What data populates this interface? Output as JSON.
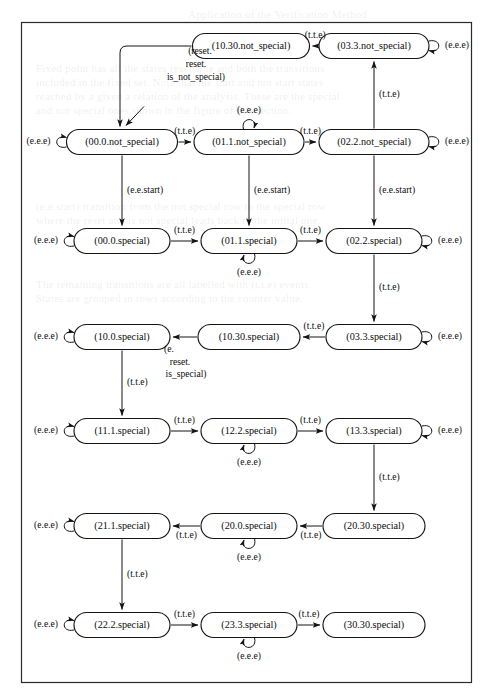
{
  "figure": {
    "kind": "state-transition-diagram",
    "width": 493,
    "height": 699,
    "frame": {
      "x": 21,
      "y": 22,
      "width": 451,
      "height": 661
    },
    "ink_color": "#141414",
    "background": "#ffffff"
  },
  "nodes": [
    {
      "id": "n_10_30_ns",
      "label": "(10.30.not_special)",
      "cx": 251,
      "cy": 46,
      "w": 117,
      "h": 25
    },
    {
      "id": "n_03_3_ns",
      "label": "(03.3.not_special)",
      "cx": 374,
      "cy": 46,
      "w": 110,
      "h": 25
    },
    {
      "id": "n_00_0_ns",
      "label": "(00.0.not_special)",
      "cx": 122,
      "cy": 142,
      "w": 111,
      "h": 25
    },
    {
      "id": "n_01_1_ns",
      "label": "(01.1.not_special)",
      "cx": 249,
      "cy": 142,
      "w": 110,
      "h": 25
    },
    {
      "id": "n_02_2_ns",
      "label": "(02.2.not_special)",
      "cx": 374,
      "cy": 142,
      "w": 110,
      "h": 25
    },
    {
      "id": "n_00_0_s",
      "label": "(00.0.special)",
      "cx": 122,
      "cy": 241,
      "w": 96,
      "h": 25
    },
    {
      "id": "n_01_1_s",
      "label": "(01.1.special)",
      "cx": 249,
      "cy": 241,
      "w": 96,
      "h": 25
    },
    {
      "id": "n_02_2_s",
      "label": "(02.2.special)",
      "cx": 374,
      "cy": 241,
      "w": 96,
      "h": 25
    },
    {
      "id": "n_10_0_s",
      "label": "(10.0.special)",
      "cx": 122,
      "cy": 337,
      "w": 96,
      "h": 25
    },
    {
      "id": "n_10_30_s",
      "label": "(10.30.special)",
      "cx": 249,
      "cy": 337,
      "w": 102,
      "h": 25
    },
    {
      "id": "n_03_3_s",
      "label": "(03.3.special)",
      "cx": 374,
      "cy": 337,
      "w": 96,
      "h": 25
    },
    {
      "id": "n_11_1_s",
      "label": "(11.1.special)",
      "cx": 122,
      "cy": 431,
      "w": 96,
      "h": 25
    },
    {
      "id": "n_12_2_s",
      "label": "(12.2.special)",
      "cx": 249,
      "cy": 431,
      "w": 96,
      "h": 25
    },
    {
      "id": "n_13_3_s",
      "label": "(13.3.special)",
      "cx": 374,
      "cy": 431,
      "w": 96,
      "h": 25
    },
    {
      "id": "n_21_1_s",
      "label": "(21.1.special)",
      "cx": 122,
      "cy": 526,
      "w": 96,
      "h": 25
    },
    {
      "id": "n_20_0_s",
      "label": "(20.0.special)",
      "cx": 249,
      "cy": 526,
      "w": 96,
      "h": 25
    },
    {
      "id": "n_20_30_s",
      "label": "(20.30.special)",
      "cx": 374,
      "cy": 526,
      "w": 102,
      "h": 25
    },
    {
      "id": "n_22_2_s",
      "label": "(22.2.special)",
      "cx": 122,
      "cy": 625,
      "w": 96,
      "h": 25
    },
    {
      "id": "n_23_3_s",
      "label": "(23.3.special)",
      "cx": 249,
      "cy": 625,
      "w": 96,
      "h": 25
    },
    {
      "id": "n_30_30_s",
      "label": "(30.30.special)",
      "cx": 374,
      "cy": 625,
      "w": 102,
      "h": 25
    }
  ],
  "self_loops": [
    {
      "node": "n_03_3_ns",
      "side": "right",
      "label": "(e.e.e)"
    },
    {
      "node": "n_00_0_ns",
      "side": "left",
      "label": "(e.e.e)"
    },
    {
      "node": "n_01_1_ns",
      "side": "top",
      "label": "(e.e.e)"
    },
    {
      "node": "n_02_2_ns",
      "side": "right",
      "label": "(e.e.e)"
    },
    {
      "node": "n_00_0_s",
      "side": "left",
      "label": "(e.e.e)"
    },
    {
      "node": "n_01_1_s",
      "side": "bottom",
      "label": "(e.e.e)"
    },
    {
      "node": "n_02_2_s",
      "side": "right",
      "label": "(e.e.e)"
    },
    {
      "node": "n_10_0_s",
      "side": "left",
      "label": "(e.e.e)"
    },
    {
      "node": "n_03_3_s",
      "side": "right",
      "label": "(e.e.e)"
    },
    {
      "node": "n_11_1_s",
      "side": "left",
      "label": "(e.e.e)"
    },
    {
      "node": "n_12_2_s",
      "side": "bottom",
      "label": "(e.e.e)"
    },
    {
      "node": "n_13_3_s",
      "side": "right",
      "label": "(e.e.e)"
    },
    {
      "node": "n_21_1_s",
      "side": "left",
      "label": "(e.e.e)"
    },
    {
      "node": "n_20_0_s",
      "side": "bottom",
      "label": "(e.e.e)"
    },
    {
      "node": "n_22_2_s",
      "side": "left",
      "label": "(e.e.e)"
    },
    {
      "node": "n_23_3_s",
      "side": "bottom",
      "label": "(e.e.e)"
    }
  ],
  "edges": [
    {
      "id": "e1",
      "from": "n_03_3_ns",
      "to": "n_10_30_ns",
      "label": "(t.t.e)"
    },
    {
      "id": "e2",
      "from": "n_10_30_ns",
      "to": "n_00_0_ns",
      "label": "(reset. reset. is_not_special)",
      "label_lines": [
        "(reset.",
        "reset.",
        "is_not_special)"
      ]
    },
    {
      "id": "e3",
      "from": "n_00_0_ns",
      "to": "n_01_1_ns",
      "label": "(t.t.e)"
    },
    {
      "id": "e4",
      "from": "n_01_1_ns",
      "to": "n_02_2_ns",
      "label": "(t.t.e)"
    },
    {
      "id": "e5",
      "from": "n_02_2_ns",
      "to": "n_03_3_ns",
      "label": "(t.t.e)"
    },
    {
      "id": "e6",
      "from": "n_00_0_ns",
      "to": "n_00_0_s",
      "label": "(e.e.start)"
    },
    {
      "id": "e7",
      "from": "n_01_1_ns",
      "to": "n_01_1_s",
      "label": "(e.e.start)"
    },
    {
      "id": "e8",
      "from": "n_02_2_ns",
      "to": "n_02_2_s",
      "label": "(e.e.start)"
    },
    {
      "id": "e9",
      "from": "n_00_0_s",
      "to": "n_01_1_s",
      "label": "(t.t.e)"
    },
    {
      "id": "e10",
      "from": "n_01_1_s",
      "to": "n_02_2_s",
      "label": "(t.t.e)"
    },
    {
      "id": "e11",
      "from": "n_02_2_s",
      "to": "n_03_3_s",
      "label": "(t.t.e)"
    },
    {
      "id": "e12",
      "from": "n_03_3_s",
      "to": "n_10_30_s",
      "label": "(t.t.e)"
    },
    {
      "id": "e13",
      "from": "n_10_30_s",
      "to": "n_10_0_s",
      "label": "(e. reset. is_special)",
      "label_lines": [
        "(e.",
        "reset.",
        "is_special)"
      ]
    },
    {
      "id": "e14",
      "from": "n_10_0_s",
      "to": "n_11_1_s",
      "label": "(t.t.e)"
    },
    {
      "id": "e15",
      "from": "n_11_1_s",
      "to": "n_12_2_s",
      "label": "(t.t.e)"
    },
    {
      "id": "e16",
      "from": "n_12_2_s",
      "to": "n_13_3_s",
      "label": "(t.t.e)"
    },
    {
      "id": "e17",
      "from": "n_13_3_s",
      "to": "n_20_30_s",
      "label": "(t.t.e)"
    },
    {
      "id": "e18",
      "from": "n_20_30_s",
      "to": "n_20_0_s",
      "label": "(t.t.e)"
    },
    {
      "id": "e19",
      "from": "n_20_0_s",
      "to": "n_21_1_s",
      "label": "(t.t.e)"
    },
    {
      "id": "e20",
      "from": "n_21_1_s",
      "to": "n_22_2_s",
      "label": "(t.t.e)"
    },
    {
      "id": "e21",
      "from": "n_22_2_s",
      "to": "n_23_3_s",
      "label": "(t.t.e)"
    },
    {
      "id": "e22",
      "from": "n_23_3_s",
      "to": "n_30_30_s",
      "label": "(t.t.e)"
    }
  ],
  "initial_state": {
    "target": "n_00_0_ns",
    "marker": "arrow"
  },
  "edge_labels": {
    "tte": "(t.t.e)",
    "eee": "(e.e.e)",
    "ee_start": "(e.e.start)",
    "reset_line1": "(reset.",
    "reset_line2": "reset.",
    "reset_line3": "is_not_special)",
    "isspecial_line1": "(e.",
    "isspecial_line2": "reset.",
    "isspecial_line3": "is_special)"
  },
  "background_text": [
    {
      "text": "Application of the Verification Method",
      "x": 188,
      "y": 8
    },
    {
      "text": "Fixed point has all the states reachable and both the transitions",
      "x": 36,
      "y": 62
    },
    {
      "text": "included in the fixed set. Note that the start and not start states",
      "x": 36,
      "y": 76
    },
    {
      "text": "reached by a given a relation of the analysis. These are the special",
      "x": 36,
      "y": 90
    },
    {
      "text": "and not special ones shown in the figure of this section.",
      "x": 36,
      "y": 104
    },
    {
      "text": "(e.e.start) transition from the not special row to the special row",
      "x": 36,
      "y": 200
    },
    {
      "text": "where the reset and is not special leads back to the initial one.",
      "x": 36,
      "y": 214
    },
    {
      "text": "The remaining transitions are all labelled with (t.t.e) events.",
      "x": 36,
      "y": 278
    },
    {
      "text": "States are grouped in rows according to the counter value.",
      "x": 36,
      "y": 292
    }
  ]
}
